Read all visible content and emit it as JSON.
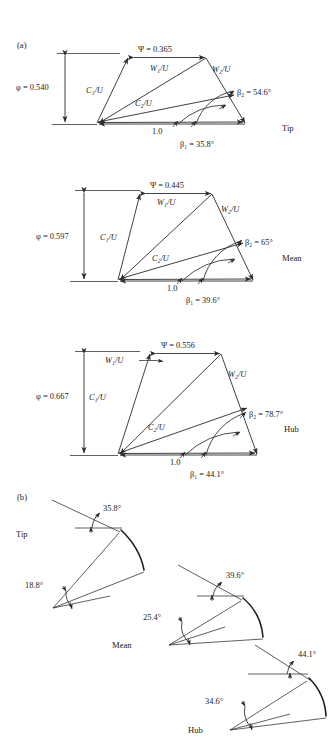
{
  "figure": {
    "panel_a_label": "(a)",
    "panel_b_label": "(b)"
  },
  "symbols": {
    "psi": "Ψ",
    "phi": "φ",
    "beta": "β",
    "degree": "°",
    "equals": "="
  },
  "velocity_triangles": [
    {
      "station": "Tip",
      "psi_label": "Ψ = 0.365",
      "psi_value": 0.365,
      "phi_label": "φ = 0.540",
      "phi_value": 0.54,
      "base_label": "1.0",
      "base_value": 1.0,
      "beta1_label": "β₁ = 35.8°",
      "beta1_value": 35.8,
      "beta2_label": "β₂ = 54.6°",
      "beta2_value": 54.6,
      "c1_label": "C₁/U",
      "c2_label": "C₂/U",
      "w1_label": "W₁/U",
      "w2_label": "W₂/U",
      "w1_leader": false
    },
    {
      "station": "Mean",
      "psi_label": "Ψ = 0.445",
      "psi_value": 0.445,
      "phi_label": "φ = 0.597",
      "phi_value": 0.597,
      "base_label": "1.0",
      "base_value": 1.0,
      "beta1_label": "β₁ = 39.6°",
      "beta1_value": 39.6,
      "beta2_label": "β₂ = 65°",
      "beta2_value": 65,
      "c1_label": "C₁/U",
      "c2_label": "C₂/U",
      "w1_label": "W₁/U",
      "w2_label": "W₂/U",
      "w1_leader": false
    },
    {
      "station": "Hub",
      "psi_label": "Ψ = 0.556",
      "psi_value": 0.556,
      "phi_label": "φ = 0.667",
      "phi_value": 0.667,
      "base_label": "1.0",
      "base_value": 1.0,
      "beta1_label": "β₁ = 44.1°",
      "beta1_value": 44.1,
      "beta2_label": "β₂ = 78.7°",
      "beta2_value": 78.7,
      "c1_label": "C₁/U",
      "c2_label": "C₂/U",
      "w1_label": "W₁/U",
      "w2_label": "W₂/U",
      "w1_leader": true
    }
  ],
  "blade_profiles": [
    {
      "station": "Tip",
      "inlet_angle_label": "35.8°",
      "inlet_angle_value": 35.8,
      "outlet_angle_label": "18.8°",
      "outlet_angle_value": 18.8
    },
    {
      "station": "Mean",
      "inlet_angle_label": "39.6°",
      "inlet_angle_value": 39.6,
      "outlet_angle_label": "25.4°",
      "outlet_angle_value": 25.4
    },
    {
      "station": "Hub",
      "inlet_angle_label": "44.1°",
      "inlet_angle_value": 44.1,
      "outlet_angle_label": "34.6°",
      "outlet_angle_value": 34.6
    }
  ],
  "colors": {
    "line": "#2b2b2b",
    "text": "#1a1a1a",
    "background": "#ffffff"
  }
}
